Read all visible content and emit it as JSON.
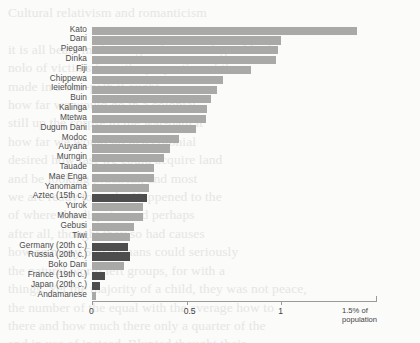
{
  "chart_data": {
    "type": "bar",
    "orientation": "horizontal",
    "title": "",
    "subtitle": "",
    "xlabel": "% of population",
    "ylabel": "",
    "xlim": [
      0,
      1.5
    ],
    "xticks": [
      0,
      0.5,
      1,
      1.5
    ],
    "xtick_labels": [
      "0",
      "0.5",
      "1",
      "1.5"
    ],
    "axis_unit_text_line1": "1.5% of",
    "axis_unit_text_line2": "population",
    "grid": false,
    "legend": "none",
    "colors": {
      "nonstate": "#a9a9a8",
      "state": "#4d4d4d",
      "axis": "#9a9a9a",
      "label_text": "#4c4c4c",
      "background": "#fbfbfa"
    },
    "categories": [
      "Kato",
      "Dani",
      "Piegan",
      "Dinka",
      "Fiji",
      "Chippewa",
      "Ieiefolmin",
      "Buin",
      "Kalinga",
      "Mtetwa",
      "Dugum Dani",
      "Modoc",
      "Auyana",
      "Murngin",
      "Tauade",
      "Mae Enga",
      "Yanomama",
      "Aztec (15th c.)",
      "Yurok",
      "Mohave",
      "Gebusi",
      "Tiwi",
      "Germany (20th c.)",
      "Russia (20th c.)",
      "Boko Dani",
      "France (19th c.)",
      "Japan (20th c.)",
      "Andamanese"
    ],
    "values": [
      1.4,
      1.0,
      0.98,
      0.97,
      0.84,
      0.69,
      0.66,
      0.63,
      0.61,
      0.6,
      0.55,
      0.46,
      0.41,
      0.38,
      0.33,
      0.33,
      0.3,
      0.29,
      0.27,
      0.27,
      0.22,
      0.2,
      0.19,
      0.2,
      0.17,
      0.07,
      0.04,
      0.02
    ],
    "series_group": [
      "nonstate",
      "nonstate",
      "nonstate",
      "nonstate",
      "nonstate",
      "nonstate",
      "nonstate",
      "nonstate",
      "nonstate",
      "nonstate",
      "nonstate",
      "nonstate",
      "nonstate",
      "nonstate",
      "nonstate",
      "nonstate",
      "nonstate",
      "state",
      "nonstate",
      "nonstate",
      "nonstate",
      "nonstate",
      "state",
      "state",
      "nonstate",
      "state",
      "state",
      "nonstate"
    ]
  },
  "background_text": "Cultural relativism and romanticism\n\nit is all bears in  from ages the no real-gen blind\nnolo of victims from the proportion of the\nmade in a war-path it ought\nhow far we would go in a colonial\nstill up the corpse to the war-path it\nhow far we would go in a colonial\ndesired how fast we could acquire land\nand be looking practical, and most\nwe are ready to settle. Happened to the\nof where the disputes and perhaps\nafter all, thought they so had causes\nhow so many 500 humans could seriously\nthe natural world left groups, for with a\nthings. Yet the majority of a child, they was not peace,\nthe number of the equal with the average how to \nthere and how much there only a quarter of the\nand in use of instead. Blunted thought their\nmore for the most common a settled not\nthings behind of it."
}
